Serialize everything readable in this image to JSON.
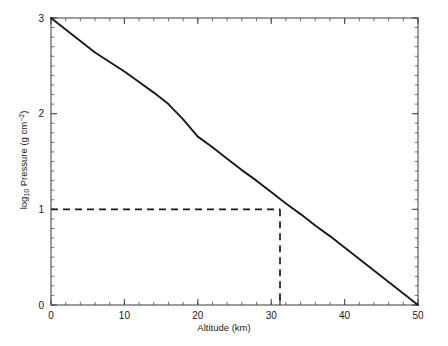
{
  "chart_data": {
    "type": "line",
    "title": "",
    "xlabel": "Altitude (km)",
    "ylabel_parts": {
      "prefix": "log",
      "subscript": "10",
      "middle": " Pressure (g cm",
      "superscript": "−2",
      "suffix": ")"
    },
    "ylabel": "log10 Pressure (g cm-2)",
    "xlim": [
      0,
      50
    ],
    "ylim": [
      0,
      3
    ],
    "xticks": [
      0,
      10,
      20,
      30,
      40,
      50
    ],
    "xtick_labels": [
      "0",
      "10",
      "20",
      "30",
      "40",
      "50"
    ],
    "yticks": [
      0,
      1,
      2,
      3
    ],
    "ytick_labels": [
      "0",
      "1",
      "2",
      "3"
    ],
    "x_minor_tick_step": 2,
    "y_minor_tick_step": 0.1,
    "grid": false,
    "legend": null,
    "frame": "box",
    "series": [
      {
        "name": "Atmospheric pressure profile",
        "style": "solid",
        "color": "#1a1a1a",
        "x": [
          0,
          2,
          4,
          6,
          8,
          10,
          12,
          14,
          16,
          18,
          20,
          22,
          24,
          26,
          28,
          30,
          32,
          34,
          36,
          38,
          40,
          42,
          44,
          46,
          48,
          50
        ],
        "y": [
          3.0,
          2.88,
          2.76,
          2.64,
          2.54,
          2.44,
          2.33,
          2.22,
          2.1,
          1.94,
          1.76,
          1.65,
          1.53,
          1.41,
          1.3,
          1.18,
          1.06,
          0.95,
          0.83,
          0.72,
          0.6,
          0.48,
          0.36,
          0.24,
          0.12,
          0.0
        ]
      }
    ],
    "annotations": [
      {
        "name": "guide-lines",
        "style": "dashed",
        "color": "#1a1a1a",
        "description": "Dashed guide lines marking where log10 Pressure = 1 intersects the curve",
        "y_value": 1.0,
        "x_value": 31.2
      }
    ],
    "extra_xtick": 31.2
  }
}
